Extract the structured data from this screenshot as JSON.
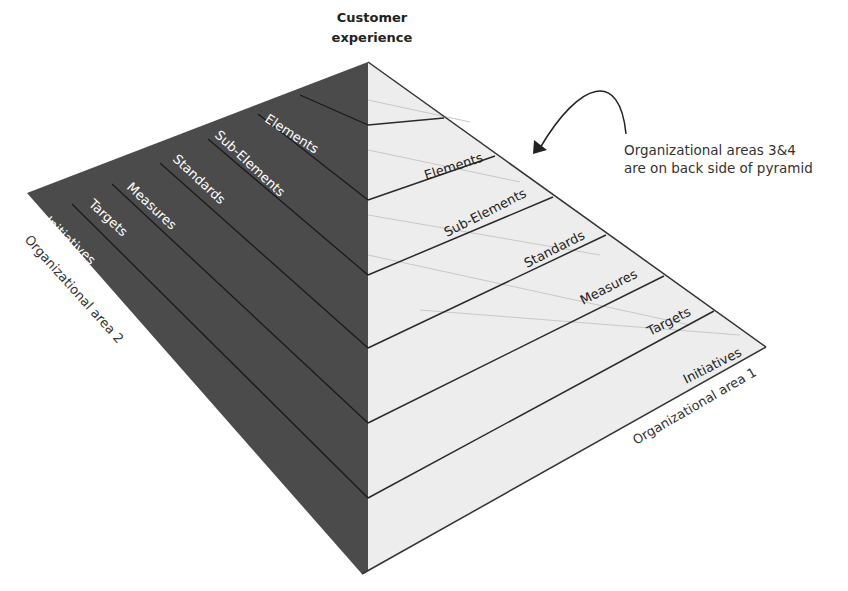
{
  "apex_label": {
    "line1": "Customer",
    "line2": "experience"
  },
  "note": {
    "line1": "Organizational areas 3&4",
    "line2": "are on back side of pyramid"
  },
  "left_face": {
    "area_label": "Organizational area 2",
    "layers": [
      "Elements",
      "Sub-Elements",
      "Standards",
      "Measures",
      "Targets",
      "Initiatives"
    ]
  },
  "right_face": {
    "area_label": "Organizational area 1",
    "layers": [
      "Elements",
      "Sub-Elements",
      "Standards",
      "Measures",
      "Targets",
      "Initiatives"
    ]
  },
  "colors": {
    "left_face": "#4a4a4a",
    "right_face": "#ececec",
    "lines": "#222222"
  }
}
